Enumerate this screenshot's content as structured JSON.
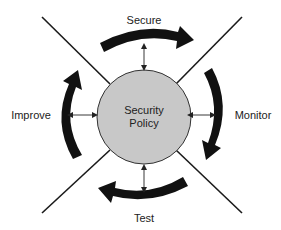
{
  "diagram": {
    "center": {
      "line1": "Security",
      "line2": "Policy",
      "fill": "#c8c8c8"
    },
    "stages": [
      {
        "name": "Secure",
        "position": "top"
      },
      {
        "name": "Monitor",
        "position": "right"
      },
      {
        "name": "Test",
        "position": "bottom"
      },
      {
        "name": "Improve",
        "position": "left"
      }
    ],
    "flow": "clockwise",
    "arrow_color": "#111111",
    "line_color": "#1a1a1a"
  }
}
